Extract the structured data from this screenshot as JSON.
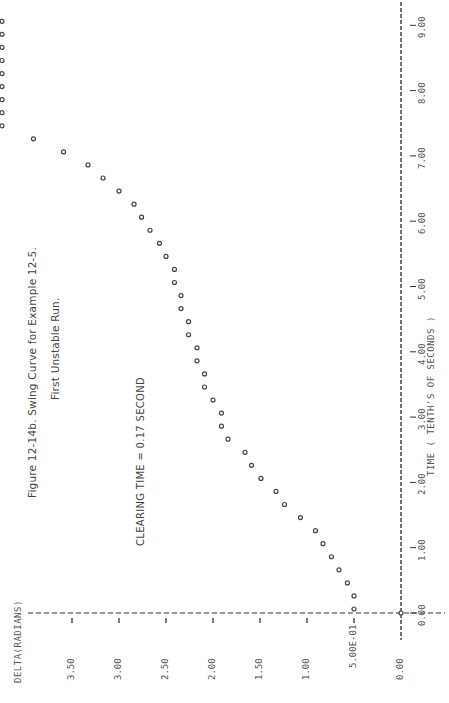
{
  "figure": {
    "caption_line1": "Figure 12-14b. Swing Curve for Example 12-5.",
    "caption_line2": "First Unstable Run.",
    "annotation": "CLEARING TIME = 0.17  SECOND",
    "orientation": "rotated 90° counter-clockwise"
  },
  "axes": {
    "y_title": "DELTA(RADIANS)",
    "x_title": "TIME ( TENTH'S OF SECONDS )",
    "y_ticks": [
      "0.00",
      "5.00E-01",
      "1.00",
      "1.50",
      "2.00",
      "2.50",
      "3.00",
      "3.50"
    ],
    "x_ticks": [
      "0.00",
      "1.00",
      "2.00",
      "3.00",
      "4.00",
      "5.00",
      "6.00",
      "7.00",
      "8.00",
      "9.00"
    ]
  },
  "chart_data": {
    "type": "scatter",
    "xlabel": "TIME ( TENTH'S OF SECONDS )",
    "ylabel": "DELTA(RADIANS)",
    "xlim": [
      0,
      9
    ],
    "ylim": [
      0,
      3.5
    ],
    "grid": false,
    "legend": null,
    "annotations": [
      "CLEARING TIME = 0.17  SECOND"
    ],
    "series": [
      {
        "name": "delta",
        "x": [
          0.0,
          0.2,
          0.4,
          0.6,
          0.8,
          1.0,
          1.2,
          1.4,
          1.6,
          1.8,
          2.0,
          2.2,
          2.4,
          2.6,
          2.8,
          3.0,
          3.2,
          3.4,
          3.6,
          3.8,
          4.0,
          4.2,
          4.4,
          4.6,
          4.8,
          5.0,
          5.2,
          5.4,
          5.6,
          5.8,
          6.0,
          6.2,
          6.4,
          6.6,
          6.8,
          7.0,
          7.2
        ],
        "y": [
          0.5,
          0.5,
          0.57,
          0.66,
          0.74,
          0.83,
          0.91,
          1.07,
          1.24,
          1.33,
          1.49,
          1.59,
          1.66,
          1.84,
          1.91,
          1.91,
          2.0,
          2.09,
          2.09,
          2.17,
          2.17,
          2.26,
          2.26,
          2.34,
          2.34,
          2.41,
          2.41,
          2.5,
          2.57,
          2.67,
          2.76,
          2.84,
          3.0,
          3.17,
          3.33,
          3.59,
          3.91
        ]
      },
      {
        "name": "delta (off-scale, clipped at plot edge)",
        "x": [
          7.4,
          7.6,
          7.8,
          8.0,
          8.2,
          8.4,
          8.6,
          8.8,
          9.0
        ],
        "y": [
          ">4.2",
          ">4.2",
          ">4.2",
          ">4.2",
          ">4.2",
          ">4.2",
          ">4.2",
          ">4.2",
          ">4.2"
        ]
      }
    ]
  },
  "render": {
    "origin_px": [
      401,
      613
    ],
    "px_per_radian": 94,
    "px_per_tenth": 65.3,
    "offscale_px_x": 2
  }
}
